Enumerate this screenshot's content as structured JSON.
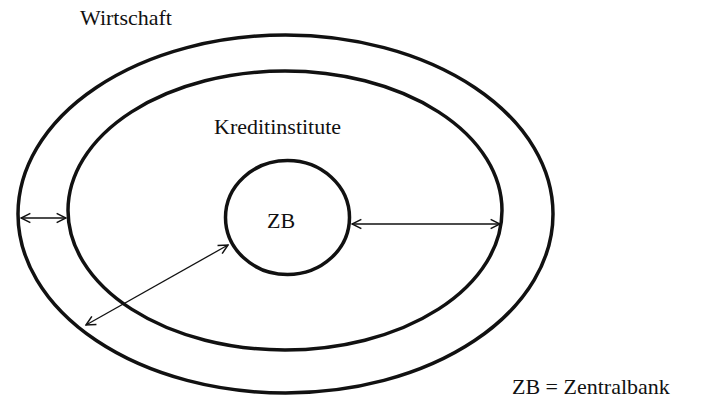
{
  "diagram": {
    "outer_label": "Wirtschaft",
    "middle_label": "Kreditinstitute",
    "inner_label": "ZB",
    "legend": "ZB = Zentralbank",
    "stroke_color": "#111111",
    "background": "#ffffff"
  }
}
